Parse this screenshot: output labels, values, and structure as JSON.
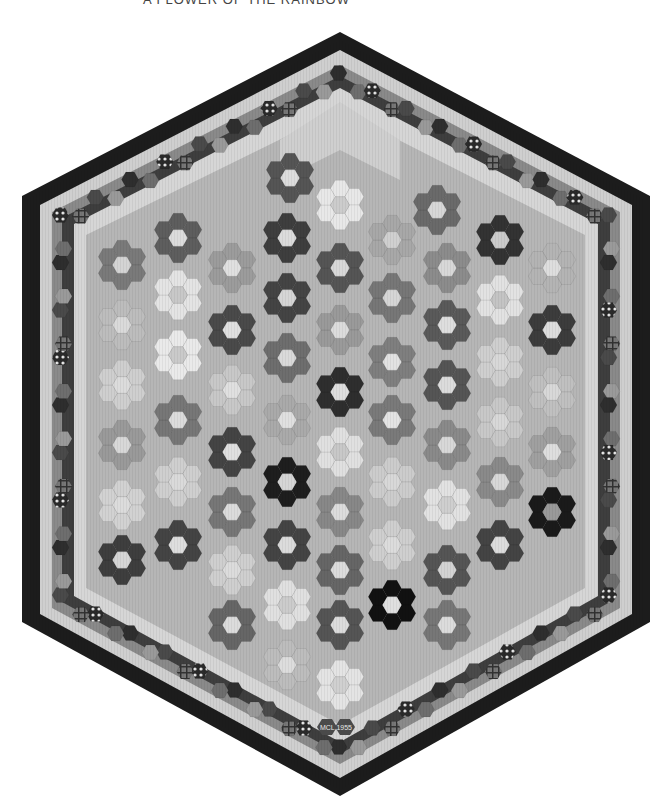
{
  "caption": "A FLOWER OF THE RAINBOW",
  "quilt": {
    "title": "Hexagon flower garden quilt",
    "signature": "MCL 1955",
    "colors": {
      "outer_border": "#1c1c1c",
      "light_ring": "#cfcfcf",
      "mid_ring": "#8a8a8a",
      "dark_ring": "#3a3a3a",
      "field": "#b4b4b4",
      "path": "#c4c4c4",
      "center": "#dcdcdc"
    },
    "flowers": [
      {
        "cx": 290,
        "cy": 178,
        "petal": "#555",
        "center": "#ddd"
      },
      {
        "cx": 340,
        "cy": 205,
        "petal": "#e8e8e8",
        "center": "#ccc"
      },
      {
        "cx": 437,
        "cy": 210,
        "petal": "#6a6a6a",
        "center": "#d8d8d8"
      },
      {
        "cx": 122,
        "cy": 265,
        "petal": "#7a7a7a",
        "center": "#d4d4d4"
      },
      {
        "cx": 178,
        "cy": 238,
        "petal": "#5e5e5e",
        "center": "#dcdcdc"
      },
      {
        "cx": 232,
        "cy": 268,
        "petal": "#9c9c9c",
        "center": "#e0e0e0"
      },
      {
        "cx": 287,
        "cy": 238,
        "petal": "#3e3e3e",
        "center": "#dcdcdc"
      },
      {
        "cx": 340,
        "cy": 268,
        "petal": "#555",
        "center": "#d8d8d8"
      },
      {
        "cx": 392,
        "cy": 240,
        "petal": "#a8a8a8",
        "center": "#d0d0d0"
      },
      {
        "cx": 447,
        "cy": 268,
        "petal": "#8c8c8c",
        "center": "#d8d8d8"
      },
      {
        "cx": 500,
        "cy": 240,
        "petal": "#333",
        "center": "#cccccc"
      },
      {
        "cx": 552,
        "cy": 268,
        "petal": "#b4b4b4",
        "center": "#dedede"
      },
      {
        "cx": 122,
        "cy": 325,
        "petal": "#bdbdbd",
        "center": "#dadada"
      },
      {
        "cx": 178,
        "cy": 295,
        "petal": "#e4e4e4",
        "center": "#c8c8c8"
      },
      {
        "cx": 232,
        "cy": 330,
        "petal": "#4a4a4a",
        "center": "#e0e0e0"
      },
      {
        "cx": 287,
        "cy": 298,
        "petal": "#444",
        "center": "#d6d6d6"
      },
      {
        "cx": 340,
        "cy": 330,
        "petal": "#9a9a9a",
        "center": "#dcdcdc"
      },
      {
        "cx": 392,
        "cy": 298,
        "petal": "#777",
        "center": "#d6d6d6"
      },
      {
        "cx": 447,
        "cy": 325,
        "petal": "#5a5a5a",
        "center": "#dedede"
      },
      {
        "cx": 500,
        "cy": 300,
        "petal": "#e2e2e2",
        "center": "#c4c4c4"
      },
      {
        "cx": 552,
        "cy": 330,
        "petal": "#3c3c3c",
        "center": "#dddddd"
      },
      {
        "cx": 122,
        "cy": 385,
        "petal": "#cfcfcf",
        "center": "#dcdcdc"
      },
      {
        "cx": 178,
        "cy": 355,
        "petal": "#eaeaea",
        "center": "#cacaca"
      },
      {
        "cx": 232,
        "cy": 390,
        "petal": "#c8c8c8",
        "center": "#e0e0e0"
      },
      {
        "cx": 287,
        "cy": 358,
        "petal": "#6e6e6e",
        "center": "#dadada"
      },
      {
        "cx": 340,
        "cy": 392,
        "petal": "#2e2e2e",
        "center": "#dedede"
      },
      {
        "cx": 392,
        "cy": 362,
        "petal": "#7f7f7f",
        "center": "#e2e2e2"
      },
      {
        "cx": 447,
        "cy": 385,
        "petal": "#555",
        "center": "#dcdcdc"
      },
      {
        "cx": 500,
        "cy": 362,
        "petal": "#cfcfcf",
        "center": "#d8d8d8"
      },
      {
        "cx": 552,
        "cy": 392,
        "petal": "#c0c0c0",
        "center": "#d8d8d8"
      },
      {
        "cx": 122,
        "cy": 445,
        "petal": "#9a9a9a",
        "center": "#d8d8d8"
      },
      {
        "cx": 178,
        "cy": 420,
        "petal": "#777",
        "center": "#dcdcdc"
      },
      {
        "cx": 232,
        "cy": 452,
        "petal": "#444",
        "center": "#e0e0e0"
      },
      {
        "cx": 287,
        "cy": 420,
        "petal": "#aaaaaa",
        "center": "#e0e0e0"
      },
      {
        "cx": 340,
        "cy": 452,
        "petal": "#e0e0e0",
        "center": "#c8c8c8"
      },
      {
        "cx": 392,
        "cy": 420,
        "petal": "#7a7a7a",
        "center": "#e4e4e4"
      },
      {
        "cx": 447,
        "cy": 445,
        "petal": "#8a8a8a",
        "center": "#d8d8d8"
      },
      {
        "cx": 500,
        "cy": 422,
        "petal": "#c8c8c8",
        "center": "#d8d8d8"
      },
      {
        "cx": 552,
        "cy": 452,
        "petal": "#a0a0a0",
        "center": "#dedede"
      },
      {
        "cx": 122,
        "cy": 505,
        "petal": "#d2d2d2",
        "center": "#dcdcdc"
      },
      {
        "cx": 178,
        "cy": 482,
        "petal": "#cfcfcf",
        "center": "#dadada"
      },
      {
        "cx": 232,
        "cy": 512,
        "petal": "#777",
        "center": "#dcdcdc"
      },
      {
        "cx": 287,
        "cy": 482,
        "petal": "#1e1e1e",
        "center": "#d6d6d6"
      },
      {
        "cx": 340,
        "cy": 512,
        "petal": "#888",
        "center": "#dcdcdc"
      },
      {
        "cx": 392,
        "cy": 482,
        "petal": "#cccccc",
        "center": "#d8d8d8"
      },
      {
        "cx": 447,
        "cy": 505,
        "petal": "#e2e2e2",
        "center": "#cfcfcf"
      },
      {
        "cx": 500,
        "cy": 482,
        "petal": "#8a8a8a",
        "center": "#d8d8d8"
      },
      {
        "cx": 552,
        "cy": 512,
        "petal": "#1a1a1a",
        "center": "#9a9a9a"
      },
      {
        "cx": 122,
        "cy": 560,
        "petal": "#3e3e3e",
        "center": "#d6d6d6"
      },
      {
        "cx": 178,
        "cy": 545,
        "petal": "#444",
        "center": "#dedede"
      },
      {
        "cx": 232,
        "cy": 570,
        "petal": "#cfcfcf",
        "center": "#dcdcdc"
      },
      {
        "cx": 287,
        "cy": 545,
        "petal": "#444",
        "center": "#dcdcdc"
      },
      {
        "cx": 340,
        "cy": 570,
        "petal": "#666",
        "center": "#dcdcdc"
      },
      {
        "cx": 392,
        "cy": 545,
        "petal": "#cfcfcf",
        "center": "#dcdcdc"
      },
      {
        "cx": 447,
        "cy": 570,
        "petal": "#555",
        "center": "#d4d4d4"
      },
      {
        "cx": 500,
        "cy": 545,
        "petal": "#444",
        "center": "#dddddd"
      },
      {
        "cx": 232,
        "cy": 625,
        "petal": "#666",
        "center": "#dcdcdc"
      },
      {
        "cx": 287,
        "cy": 605,
        "petal": "#e0e0e0",
        "center": "#cccccc"
      },
      {
        "cx": 340,
        "cy": 625,
        "petal": "#555",
        "center": "#dcdcdc"
      },
      {
        "cx": 392,
        "cy": 605,
        "petal": "#111",
        "center": "#e0e0e0"
      },
      {
        "cx": 447,
        "cy": 625,
        "petal": "#777",
        "center": "#dcdcdc"
      },
      {
        "cx": 340,
        "cy": 685,
        "petal": "#e4e4e4",
        "center": "#d0d0d0"
      },
      {
        "cx": 287,
        "cy": 665,
        "petal": "#bdbdbd",
        "center": "#dddddd"
      }
    ]
  }
}
